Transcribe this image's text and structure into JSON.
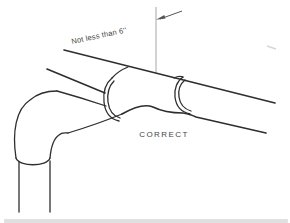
{
  "figure": {
    "dimension_note": "Not less than 6''",
    "caption": "CORRECT",
    "colors": {
      "ink": "#2e2e2e",
      "label": "#454545",
      "dimension_line": "#9c9c9c",
      "arrow": "#555555",
      "background": "#ffffff"
    }
  }
}
